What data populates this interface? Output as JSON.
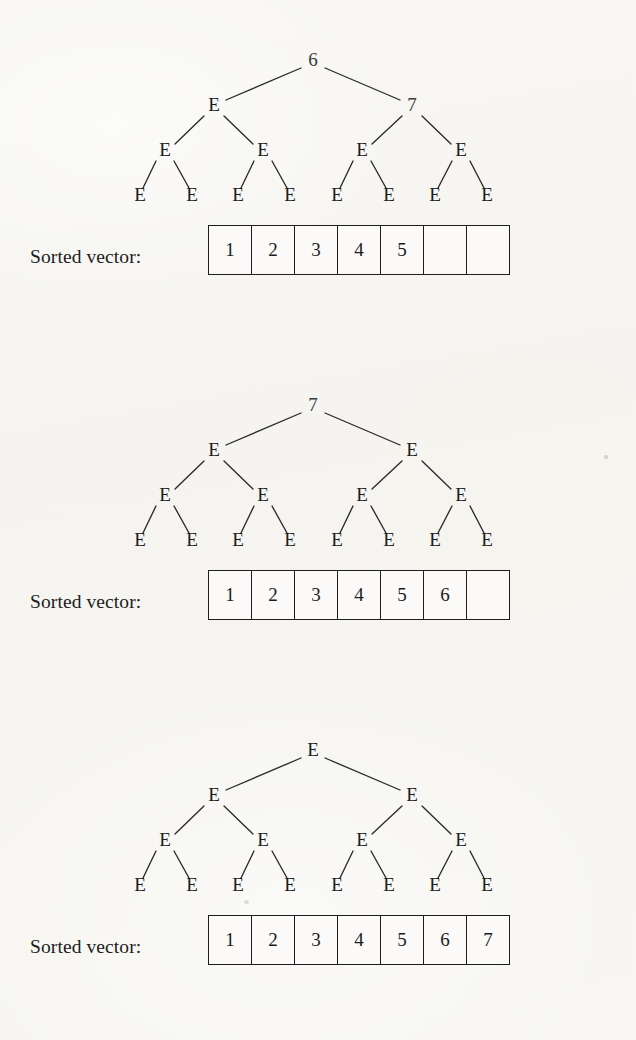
{
  "figure": {
    "background_color": "#f6f5f2",
    "ink_color": "#1e1e1e",
    "vector_label": "Sorted vector:",
    "empty_cell_text": ""
  },
  "panels": [
    {
      "id": "panel-1",
      "tree": {
        "root": "6",
        "level1": [
          "E",
          "7"
        ],
        "level2": [
          "E",
          "E",
          "E",
          "E"
        ],
        "leaves": [
          "E",
          "E",
          "E",
          "E",
          "E",
          "E",
          "E",
          "E"
        ]
      },
      "vector": {
        "label": "Sorted vector:",
        "cells": [
          "1",
          "2",
          "3",
          "4",
          "5",
          "",
          ""
        ],
        "filled_count": 5,
        "capacity": 7
      }
    },
    {
      "id": "panel-2",
      "tree": {
        "root": "7",
        "level1": [
          "E",
          "E"
        ],
        "level2": [
          "E",
          "E",
          "E",
          "E"
        ],
        "leaves": [
          "E",
          "E",
          "E",
          "E",
          "E",
          "E",
          "E",
          "E"
        ]
      },
      "vector": {
        "label": "Sorted vector:",
        "cells": [
          "1",
          "2",
          "3",
          "4",
          "5",
          "6",
          ""
        ],
        "filled_count": 6,
        "capacity": 7
      }
    },
    {
      "id": "panel-3",
      "tree": {
        "root": "E",
        "level1": [
          "E",
          "E"
        ],
        "level2": [
          "E",
          "E",
          "E",
          "E"
        ],
        "leaves": [
          "E",
          "E",
          "E",
          "E",
          "E",
          "E",
          "E",
          "E"
        ]
      },
      "vector": {
        "label": "Sorted vector:",
        "cells": [
          "1",
          "2",
          "3",
          "4",
          "5",
          "6",
          "7"
        ],
        "filled_count": 7,
        "capacity": 7
      }
    }
  ],
  "geometry": {
    "root": {
      "x": 313,
      "y": 22
    },
    "level1": [
      {
        "x": 214,
        "y": 67
      },
      {
        "x": 412,
        "y": 67
      }
    ],
    "level2": [
      {
        "x": 165,
        "y": 112
      },
      {
        "x": 263,
        "y": 112
      },
      {
        "x": 362,
        "y": 112
      },
      {
        "x": 461,
        "y": 112
      }
    ],
    "leaves": [
      {
        "x": 140,
        "y": 157
      },
      {
        "x": 192,
        "y": 157
      },
      {
        "x": 238,
        "y": 157
      },
      {
        "x": 290,
        "y": 157
      },
      {
        "x": 337,
        "y": 157
      },
      {
        "x": 389,
        "y": 157
      },
      {
        "x": 435,
        "y": 157
      },
      {
        "x": 487,
        "y": 157
      }
    ]
  }
}
